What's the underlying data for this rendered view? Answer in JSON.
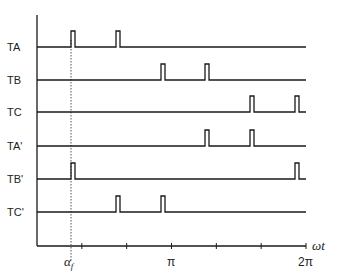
{
  "diagram": {
    "type": "pulse-timing-diagram",
    "x_axis": {
      "label": "ωt",
      "ticks": [
        {
          "pos": "α_f",
          "label": "α_f"
        },
        {
          "pos": "π",
          "label": "π"
        },
        {
          "pos": "2π",
          "label": "2π"
        }
      ],
      "minor_tick_count": 5
    },
    "alpha_label_main": "α",
    "alpha_label_sub": "f",
    "pi_label": "π",
    "two_pi_label": "2π",
    "omega_t_label": "ωt",
    "signals": [
      {
        "name": "TA",
        "pulses_at_x": [
          71,
          116
        ]
      },
      {
        "name": "TB",
        "pulses_at_x": [
          161,
          205
        ]
      },
      {
        "name": "TC",
        "pulses_at_x": [
          250,
          295
        ]
      },
      {
        "name": "TA'",
        "pulses_at_x": [
          205,
          250
        ]
      },
      {
        "name": "TB'",
        "pulses_at_x": [
          71,
          295
        ]
      },
      {
        "name": "TC'",
        "pulses_at_x": [
          116,
          161
        ]
      }
    ],
    "colors": {
      "line": "#1a1a1a",
      "dotted": "#555555",
      "background": "#ffffff"
    }
  }
}
